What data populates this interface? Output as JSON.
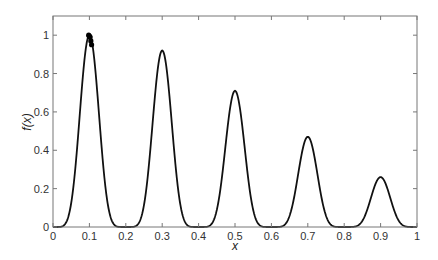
{
  "chart_data": {
    "type": "line",
    "title": "",
    "xlabel": "x",
    "ylabel": "f(x)",
    "xlim": [
      0,
      1
    ],
    "ylim": [
      0,
      1.1
    ],
    "xticks": [
      0,
      0.1,
      0.2,
      0.3,
      0.4,
      0.5,
      0.6,
      0.7,
      0.8,
      0.9,
      1
    ],
    "xtick_labels": [
      "0",
      "0.1",
      "0.2",
      "0.3",
      "0.4",
      "0.5",
      "0.6",
      "0.7",
      "0.8",
      "0.9",
      "1"
    ],
    "yticks": [
      0,
      0.2,
      0.4,
      0.6,
      0.8,
      1
    ],
    "ytick_labels": [
      "0",
      "0.2",
      "0.4",
      "0.6",
      "0.8",
      "1"
    ],
    "grid": false,
    "legend": null,
    "series": [
      {
        "name": "f(x)",
        "kind": "line",
        "color": "#111111",
        "description": "five peaks with decreasing height at x = 0.1, 0.3, 0.5, 0.7, 0.9; flat at 0 between peaks",
        "peaks": [
          {
            "x": 0.1,
            "y": 1.0
          },
          {
            "x": 0.3,
            "y": 0.92
          },
          {
            "x": 0.5,
            "y": 0.71
          },
          {
            "x": 0.7,
            "y": 0.47
          },
          {
            "x": 0.9,
            "y": 0.26
          }
        ]
      },
      {
        "name": "population",
        "kind": "scatter",
        "color": "#000000",
        "points": [
          {
            "x": 0.098,
            "y": 1.0
          },
          {
            "x": 0.1,
            "y": 0.995
          },
          {
            "x": 0.102,
            "y": 0.99
          },
          {
            "x": 0.104,
            "y": 0.97
          },
          {
            "x": 0.106,
            "y": 0.95
          }
        ]
      }
    ]
  },
  "layout": {
    "plot_left": 53,
    "plot_right": 417,
    "plot_top": 16,
    "plot_bottom": 227,
    "frame_color": "#777777"
  }
}
